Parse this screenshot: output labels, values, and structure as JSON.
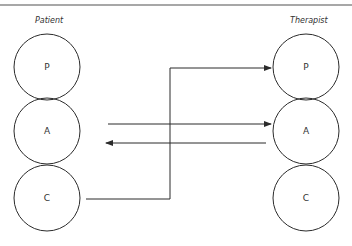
{
  "diagram": {
    "title_rule_color": "#8a8a8a",
    "stroke_color": "#2b2b2b",
    "left_column": {
      "label": "Patient",
      "nodes": [
        {
          "id": "P",
          "label": "P"
        },
        {
          "id": "A",
          "label": "A"
        },
        {
          "id": "C",
          "label": "C"
        }
      ]
    },
    "right_column": {
      "label": "Therapist",
      "nodes": [
        {
          "id": "P",
          "label": "P"
        },
        {
          "id": "A",
          "label": "A"
        },
        {
          "id": "C",
          "label": "C"
        }
      ]
    },
    "transactions": [
      {
        "from": "Patient.A",
        "to": "Therapist.A",
        "direction": "right"
      },
      {
        "from": "Therapist.A",
        "to": "Patient.A",
        "direction": "left"
      },
      {
        "from": "Patient.C",
        "to": "Therapist.P",
        "direction": "right",
        "routed": true
      }
    ]
  }
}
